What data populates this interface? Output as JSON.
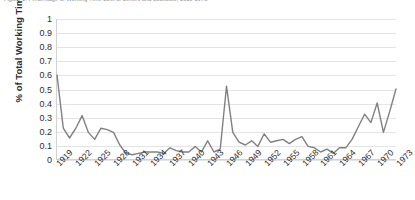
{
  "chart_data": {
    "type": "line",
    "title": "Figure 1: Percentage of Working Time Lost to Strikes and Lockouts, 1919-1973",
    "xlabel": "",
    "ylabel": "% of Total Working Time",
    "ylim": [
      0,
      1
    ],
    "ytick_labels": [
      "1",
      "0.9",
      "0.8",
      "0.7",
      "0.6",
      "0.5",
      "0.4",
      "0.3",
      "0.2",
      "0.1",
      "0"
    ],
    "ytick_values": [
      1,
      0.9,
      0.8,
      0.7,
      0.6,
      0.5,
      0.4,
      0.3,
      0.2,
      0.1,
      0
    ],
    "xtick_labels": [
      "1919",
      "1922",
      "1925",
      "1928",
      "1931",
      "1934",
      "1937",
      "1940",
      "1943",
      "1946",
      "1949",
      "1952",
      "1955",
      "1958",
      "1961",
      "1964",
      "1967",
      "1970",
      "1973"
    ],
    "xtick_step_years": 3,
    "grid": "horizontal",
    "legend": "none",
    "line_color": "#808080",
    "grid_color": "#e4e4e4",
    "axis_color": "#d2d2d2",
    "x": [
      1919,
      1920,
      1921,
      1922,
      1923,
      1924,
      1925,
      1926,
      1927,
      1928,
      1929,
      1930,
      1931,
      1932,
      1933,
      1934,
      1935,
      1936,
      1937,
      1938,
      1939,
      1940,
      1941,
      1942,
      1943,
      1944,
      1945,
      1946,
      1947,
      1948,
      1949,
      1950,
      1951,
      1952,
      1953,
      1954,
      1955,
      1956,
      1957,
      1958,
      1959,
      1960,
      1961,
      1962,
      1963,
      1964,
      1965,
      1966,
      1967,
      1968,
      1969,
      1970,
      1971,
      1972,
      1973
    ],
    "values": [
      0.6,
      0.22,
      0.15,
      0.22,
      0.31,
      0.19,
      0.14,
      0.22,
      0.21,
      0.19,
      0.1,
      0.04,
      0.03,
      0.04,
      0.05,
      0.05,
      0.05,
      0.04,
      0.08,
      0.06,
      0.05,
      0.05,
      0.09,
      0.05,
      0.13,
      0.05,
      0.07,
      0.52,
      0.19,
      0.12,
      0.1,
      0.13,
      0.09,
      0.18,
      0.12,
      0.13,
      0.14,
      0.11,
      0.14,
      0.16,
      0.09,
      0.08,
      0.05,
      0.07,
      0.04,
      0.08,
      0.08,
      0.14,
      0.23,
      0.32,
      0.26,
      0.4,
      0.19,
      0.34,
      0.5
    ],
    "series_name": "Working time lost"
  }
}
